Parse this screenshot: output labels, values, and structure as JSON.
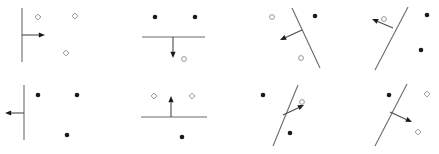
{
  "figure": {
    "title": "",
    "width": 439,
    "height": 154,
    "background_color": "#ffffff",
    "grid_rows": 2,
    "grid_cols": 4,
    "panel_count": 8
  },
  "styles": {
    "line_color": "#6b6b6b",
    "arrow_color": "#1a1a1a",
    "filled_marker_color": "#1a1a1a",
    "hollow_marker_stroke": "#8a8a8a",
    "hollow_marker_fill": "#ffffff"
  },
  "legend": {
    "filled_marker_name": "filled-dot",
    "hollow_marker_name": "hollow-marker",
    "filled_label": "",
    "hollow_label": ""
  },
  "chart_data": {
    "type": "scatter",
    "title": "",
    "xlabel": "",
    "ylabel": "",
    "panels": [
      {
        "index": 1,
        "name": "panel-1",
        "row": 1,
        "col": 1,
        "boundary": {
          "orientation": "vertical",
          "x1": 22,
          "y1": 8,
          "x2": 22,
          "y2": 62
        },
        "arrow": {
          "direction": "right",
          "from_x": 22,
          "from_y": 35,
          "to_x": 45,
          "to_y": 35
        },
        "points": [
          {
            "x": 38,
            "y": 17,
            "class": "hollow",
            "shape": "diamond"
          },
          {
            "x": 75,
            "y": 16,
            "class": "hollow",
            "shape": "diamond"
          },
          {
            "x": 66,
            "y": 53,
            "class": "hollow",
            "shape": "diamond"
          }
        ]
      },
      {
        "index": 2,
        "name": "panel-2",
        "row": 1,
        "col": 2,
        "boundary": {
          "orientation": "horizontal",
          "x1": 142,
          "y1": 37,
          "x2": 205,
          "y2": 37
        },
        "arrow": {
          "direction": "down",
          "from_x": 173,
          "from_y": 37,
          "to_x": 173,
          "to_y": 58
        },
        "points": [
          {
            "x": 155,
            "y": 17,
            "class": "filled",
            "shape": "circle"
          },
          {
            "x": 195,
            "y": 17,
            "class": "filled",
            "shape": "circle"
          },
          {
            "x": 184,
            "y": 59,
            "class": "hollow",
            "shape": "circle"
          }
        ]
      },
      {
        "index": 3,
        "name": "panel-3",
        "row": 1,
        "col": 3,
        "boundary": {
          "orientation": "tilted-right-lean",
          "x1": 292,
          "y1": 8,
          "x2": 320,
          "y2": 68
        },
        "arrow": {
          "direction": "down-left",
          "from_x": 302,
          "from_y": 30,
          "to_x": 280,
          "to_y": 40
        },
        "points": [
          {
            "x": 272,
            "y": 17,
            "class": "hollow",
            "shape": "circle"
          },
          {
            "x": 315,
            "y": 16,
            "class": "filled",
            "shape": "circle"
          },
          {
            "x": 301,
            "y": 58,
            "class": "hollow",
            "shape": "circle"
          }
        ]
      },
      {
        "index": 4,
        "name": "panel-4",
        "row": 1,
        "col": 4,
        "boundary": {
          "orientation": "tilted-right-lean",
          "x1": 408,
          "y1": 7,
          "x2": 375,
          "y2": 70
        },
        "arrow": {
          "direction": "up-left",
          "from_x": 393,
          "from_y": 28,
          "to_x": 372,
          "to_y": 19
        },
        "points": [
          {
            "x": 384,
            "y": 19,
            "class": "hollow",
            "shape": "circle"
          },
          {
            "x": 427,
            "y": 15,
            "class": "filled",
            "shape": "circle"
          },
          {
            "x": 421,
            "y": 50,
            "class": "filled",
            "shape": "circle"
          }
        ]
      },
      {
        "index": 5,
        "name": "panel-5",
        "row": 2,
        "col": 1,
        "boundary": {
          "orientation": "vertical",
          "x1": 24,
          "y1": 85,
          "x2": 24,
          "y2": 140
        },
        "arrow": {
          "direction": "left",
          "from_x": 24,
          "from_y": 113,
          "to_x": 5,
          "to_y": 113
        },
        "points": [
          {
            "x": 38,
            "y": 95,
            "class": "filled",
            "shape": "circle"
          },
          {
            "x": 77,
            "y": 95,
            "class": "filled",
            "shape": "circle"
          },
          {
            "x": 67,
            "y": 135,
            "class": "filled",
            "shape": "circle"
          }
        ]
      },
      {
        "index": 6,
        "name": "panel-6",
        "row": 2,
        "col": 2,
        "boundary": {
          "orientation": "horizontal",
          "x1": 141,
          "y1": 117,
          "x2": 207,
          "y2": 117
        },
        "arrow": {
          "direction": "up",
          "from_x": 171,
          "from_y": 117,
          "to_x": 171,
          "to_y": 96
        },
        "points": [
          {
            "x": 154,
            "y": 96,
            "class": "hollow",
            "shape": "diamond"
          },
          {
            "x": 192,
            "y": 96,
            "class": "hollow",
            "shape": "diamond"
          },
          {
            "x": 182,
            "y": 137,
            "class": "filled",
            "shape": "circle"
          }
        ]
      },
      {
        "index": 7,
        "name": "panel-7",
        "row": 2,
        "col": 3,
        "boundary": {
          "orientation": "tilted-right-lean",
          "x1": 298,
          "y1": 85,
          "x2": 273,
          "y2": 146
        },
        "arrow": {
          "direction": "up-right",
          "from_x": 283,
          "from_y": 115,
          "to_x": 304,
          "to_y": 105
        },
        "points": [
          {
            "x": 263,
            "y": 95,
            "class": "filled",
            "shape": "circle"
          },
          {
            "x": 302,
            "y": 102,
            "class": "hollow",
            "shape": "circle"
          },
          {
            "x": 290,
            "y": 133,
            "class": "filled",
            "shape": "circle"
          }
        ]
      },
      {
        "index": 8,
        "name": "panel-8",
        "row": 2,
        "col": 4,
        "boundary": {
          "orientation": "tilted-right-lean",
          "x1": 407,
          "y1": 84,
          "x2": 375,
          "y2": 146
        },
        "arrow": {
          "direction": "down-right",
          "from_x": 390,
          "from_y": 112,
          "to_x": 412,
          "to_y": 122
        },
        "points": [
          {
            "x": 389,
            "y": 95,
            "class": "filled",
            "shape": "circle"
          },
          {
            "x": 427,
            "y": 94,
            "class": "hollow",
            "shape": "diamond"
          },
          {
            "x": 418,
            "y": 132,
            "class": "hollow",
            "shape": "diamond"
          }
        ]
      }
    ]
  }
}
